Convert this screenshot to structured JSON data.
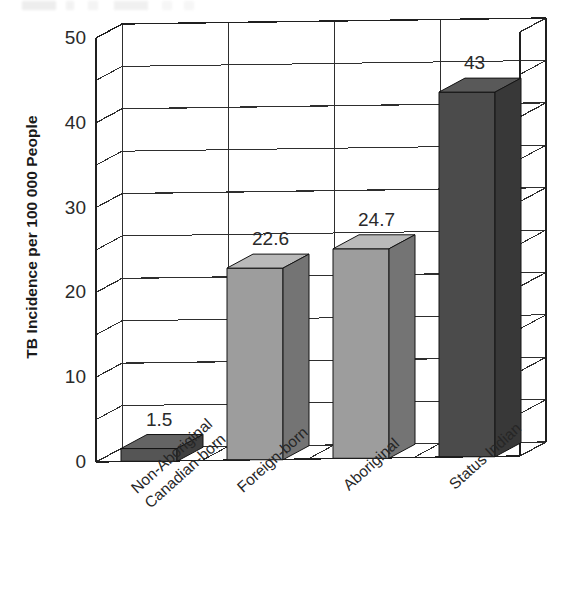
{
  "chart_data": {
    "type": "bar",
    "title": "",
    "xlabel": "",
    "ylabel": "TB Incidence per 100 000 People",
    "categories": [
      "Non-Aboriginal Canadian-born",
      "Foreign-born",
      "Aboriginal",
      "Status Indian"
    ],
    "category_lines": [
      [
        "Non-Aboriginal",
        "Canadian-born"
      ],
      [
        "Foreign-born"
      ],
      [
        "Aboriginal"
      ],
      [
        "Status Indian"
      ]
    ],
    "values": [
      1.5,
      22.6,
      24.7,
      43
    ],
    "value_labels": [
      "1.5",
      "22.6",
      "24.7",
      "43"
    ],
    "ylim": [
      0,
      50
    ],
    "ytick_labels": [
      "50",
      "40",
      "30",
      "20",
      "10",
      "0"
    ],
    "ytick_values": [
      50,
      40,
      30,
      20,
      10,
      0
    ],
    "minor_gridline_step": 5,
    "grid": true,
    "legend": "none",
    "style": "3d-bars",
    "bar_colors": [
      "#555555",
      "#9d9d9d",
      "#9d9d9d",
      "#4b4b4b"
    ]
  },
  "colors": {
    "background": "#ffffff",
    "axis": "#1f1f1f",
    "grid": "#2b2b2b",
    "text": "#242424",
    "bar_light": "#9d9d9d",
    "bar_dark": "#4b4b4b"
  }
}
